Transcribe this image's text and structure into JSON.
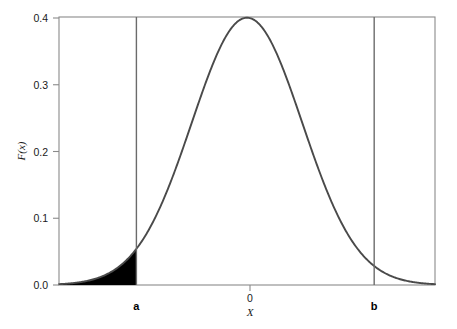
{
  "chart_data": {
    "type": "line",
    "title": "",
    "subtitle": "",
    "xlabel": "X",
    "ylabel": "F(x)",
    "xlim": [
      -3.4,
      3.4
    ],
    "ylim": [
      0.0,
      0.4
    ],
    "grid": false,
    "legend": null,
    "y_ticks": [
      {
        "value": 0.4,
        "label": "0.4"
      },
      {
        "value": 0.3,
        "label": "0.3"
      },
      {
        "value": 0.2,
        "label": "0.2"
      },
      {
        "value": 0.1,
        "label": "0.1"
      },
      {
        "value": 0.0,
        "label": "0.0"
      }
    ],
    "x_ticks": [
      {
        "value": 0,
        "label": "0"
      }
    ],
    "series": [
      {
        "name": "standard normal density",
        "distribution": "normal",
        "mean": 0,
        "sd": 1,
        "peak_value": 0.3989,
        "x": [
          -3.4,
          -3.2,
          -3.0,
          -2.8,
          -2.6,
          -2.4,
          -2.2,
          -2.0,
          -1.8,
          -1.6,
          -1.4,
          -1.2,
          -1.0,
          -0.8,
          -0.6,
          -0.4,
          -0.2,
          0.0,
          0.2,
          0.4,
          0.6,
          0.8,
          1.0,
          1.2,
          1.4,
          1.6,
          1.8,
          2.0,
          2.2,
          2.4,
          2.6,
          2.8,
          3.0,
          3.2,
          3.4
        ],
        "values": [
          0.0012,
          0.0024,
          0.0044,
          0.0079,
          0.0136,
          0.0224,
          0.0355,
          0.054,
          0.079,
          0.1109,
          0.1497,
          0.1942,
          0.242,
          0.2897,
          0.3332,
          0.3683,
          0.391,
          0.3989,
          0.391,
          0.3683,
          0.3332,
          0.2897,
          0.242,
          0.1942,
          0.1497,
          0.1109,
          0.079,
          0.054,
          0.0355,
          0.0224,
          0.0136,
          0.0079,
          0.0044,
          0.0024,
          0.0012
        ]
      }
    ],
    "vertical_lines": [
      {
        "id": "a",
        "label": "a",
        "x": -2.0,
        "style": "solid"
      },
      {
        "id": "b",
        "label": "b",
        "x": 2.3,
        "style": "solid"
      }
    ],
    "shaded_regions": [
      {
        "id": "left-tail",
        "label": "",
        "fill": "#000000",
        "x_from": -3.4,
        "x_to": -2.0,
        "description": "filled left tail of the density below x = a"
      }
    ],
    "annotations": []
  },
  "style": {
    "curve_color": "#4a4a4a",
    "frame_color": "#8a8a8a",
    "shade_color": "#000000",
    "text_color": "#1a1a1a",
    "background": "#ffffff"
  }
}
